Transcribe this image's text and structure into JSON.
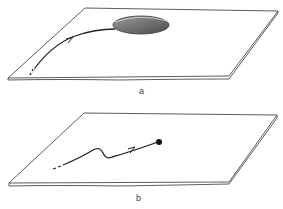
{
  "panels": [
    {
      "id": "a",
      "label": "a",
      "description": "sheet with curved trajectory ending at a shaded ellipse"
    },
    {
      "id": "b",
      "label": "b",
      "description": "sheet with wavy trajectory ending at a point"
    }
  ],
  "colors": {
    "stroke": "#333333",
    "ellipse_fill_dark": "#5a5a5a",
    "ellipse_fill_light": "#b5b5b5",
    "background": "#ffffff"
  }
}
